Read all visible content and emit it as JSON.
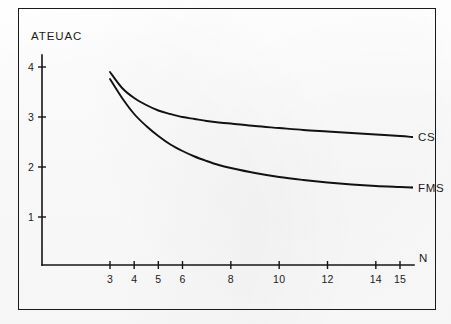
{
  "chart_data": {
    "type": "line",
    "title": "",
    "subtitle": "",
    "xlabel": "N",
    "ylabel": "ATEUAC",
    "xlim": [
      2.2,
      15.9
    ],
    "ylim": [
      0,
      4.35
    ],
    "grid": false,
    "legend_position": "right-of-curve-ends",
    "x_ticks": [
      3,
      4,
      5,
      6,
      8,
      10,
      12,
      14,
      15
    ],
    "x_tick_labels": [
      "3",
      "4",
      "5",
      "6",
      "8",
      "10",
      "12",
      "14",
      "15"
    ],
    "y_ticks": [
      1,
      2,
      3,
      4
    ],
    "y_tick_labels": [
      "1",
      "2",
      "3",
      "4"
    ],
    "annotations": [
      {
        "text": "CS",
        "x": 15.6,
        "y": 2.6
      },
      {
        "text": "FMS",
        "x": 15.6,
        "y": 1.6
      }
    ],
    "series": [
      {
        "name": "CS",
        "label": "CS",
        "color": "#111111",
        "x": [
          3.0,
          3.5,
          4.0,
          4.5,
          5.0,
          5.5,
          6.0,
          6.5,
          7.0,
          7.5,
          8.0,
          9.0,
          10.0,
          11.0,
          12.0,
          13.0,
          14.0,
          15.0,
          15.5
        ],
        "values": [
          3.9,
          3.58,
          3.38,
          3.24,
          3.13,
          3.06,
          3.0,
          2.96,
          2.92,
          2.89,
          2.87,
          2.82,
          2.78,
          2.74,
          2.71,
          2.68,
          2.65,
          2.62,
          2.6
        ]
      },
      {
        "name": "FMS",
        "label": "FMS",
        "color": "#111111",
        "x": [
          3.0,
          3.5,
          4.0,
          4.5,
          5.0,
          5.5,
          6.0,
          6.5,
          7.0,
          7.5,
          8.0,
          9.0,
          10.0,
          11.0,
          12.0,
          13.0,
          14.0,
          15.0,
          15.5
        ],
        "values": [
          3.76,
          3.38,
          3.06,
          2.82,
          2.62,
          2.45,
          2.32,
          2.21,
          2.12,
          2.04,
          1.98,
          1.88,
          1.8,
          1.74,
          1.69,
          1.65,
          1.62,
          1.6,
          1.59
        ]
      }
    ]
  }
}
